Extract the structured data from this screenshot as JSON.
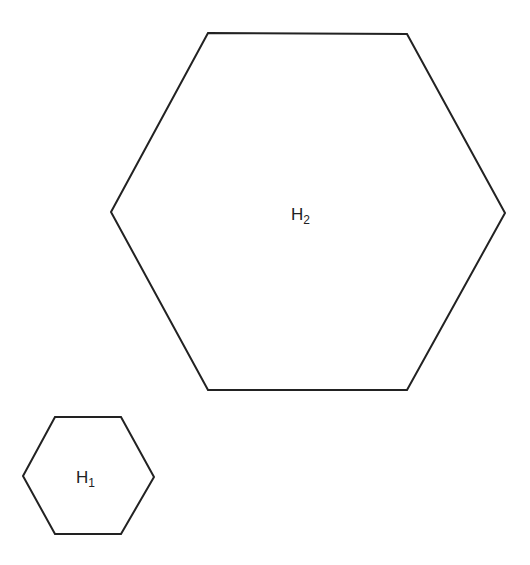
{
  "diagram": {
    "stroke_color": "#222222",
    "background": "#ffffff",
    "shapes": [
      {
        "id": "H2",
        "type": "hexagon",
        "label_main": "H",
        "label_sub": "2",
        "points": "208,33 407,34 505,213 407,390 208,390 111,212",
        "label_x": 291,
        "label_y": 220
      },
      {
        "id": "H1",
        "type": "hexagon",
        "label_main": "H",
        "label_sub": "1",
        "points": "55,417 121,417 154,477 121,534 55,534 23,476",
        "label_x": 76,
        "label_y": 483
      }
    ]
  }
}
